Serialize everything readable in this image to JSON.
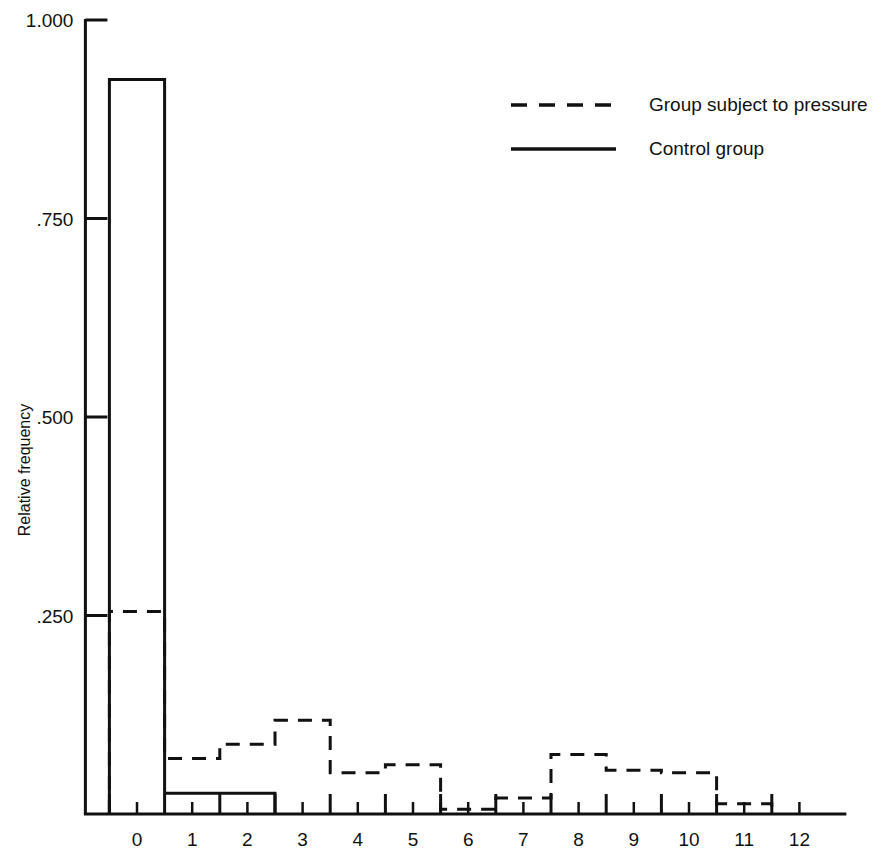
{
  "chart_data": {
    "type": "bar",
    "title": "",
    "subtitle": "",
    "xlabel": "",
    "ylabel": "Relative frequency",
    "xlim": [
      -0.5,
      13.0
    ],
    "ylim": [
      0.0,
      1.0
    ],
    "grid": false,
    "legend_position": "top-right",
    "bin_width": 1.0,
    "bin_edges": [
      -0.5,
      0.5,
      1.5,
      2.5,
      3.5,
      4.5,
      5.5,
      6.5,
      7.5,
      8.5,
      9.5,
      10.5,
      11.5
    ],
    "categories": [
      "0",
      "1",
      "2",
      "3",
      "4",
      "5",
      "6",
      "7",
      "8",
      "9",
      "10",
      "11",
      "12"
    ],
    "ytick_labels": [
      "1.000",
      ".750",
      ".500",
      ".250"
    ],
    "ytick_values": [
      1.0,
      0.75,
      0.5,
      0.25
    ],
    "xtick_labels": [
      "0",
      "1",
      "2",
      "3",
      "4",
      "5",
      "6",
      "7",
      "8",
      "9",
      "10",
      "11",
      "12"
    ],
    "xtick_values": [
      0,
      1,
      2,
      3,
      4,
      5,
      6,
      7,
      8,
      9,
      10,
      11,
      12
    ],
    "series": [
      {
        "name": "Control group",
        "style": "solid",
        "color": "#111111",
        "centers": [
          0,
          1,
          2,
          3,
          4,
          5,
          6,
          7,
          8,
          9,
          10,
          11,
          12
        ],
        "values": [
          0.925,
          0.026,
          0.026,
          0.0,
          0.0,
          0.0,
          0.0,
          0.0,
          0.0,
          0.0,
          0.0,
          0.0,
          0.0
        ]
      },
      {
        "name": "Group subject to pressure",
        "style": "dashed",
        "color": "#111111",
        "centers": [
          0,
          1,
          2,
          3,
          4,
          5,
          6,
          7,
          8,
          9,
          10,
          11,
          12
        ],
        "values": [
          0.255,
          0.07,
          0.088,
          0.118,
          0.052,
          0.062,
          0.006,
          0.02,
          0.075,
          0.055,
          0.052,
          0.013,
          0.0
        ]
      }
    ]
  },
  "legend": {
    "items": [
      {
        "label": "Group subject to pressure",
        "style": "dashed"
      },
      {
        "label": "Control group",
        "style": "solid"
      }
    ]
  }
}
